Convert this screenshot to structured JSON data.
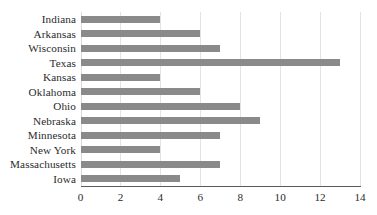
{
  "chart_data": {
    "type": "bar",
    "orientation": "horizontal",
    "title": "",
    "subtitle": "",
    "xlabel": "",
    "ylabel": "",
    "xlim": [
      0,
      14
    ],
    "xticks": [
      0,
      2,
      4,
      6,
      8,
      10,
      12,
      14
    ],
    "xtick_labels": [
      "0",
      "2",
      "4",
      "6",
      "8",
      "10",
      "12",
      "14"
    ],
    "grid": true,
    "grid_axis": "x",
    "legend": false,
    "legend_position": "none",
    "bar_color": "#8a8a8a",
    "gridline_color": "#e3e3e3",
    "axis_color": "#5a5a5a",
    "text_color": "#2b2b2b",
    "categories": [
      "Indiana",
      "Arkansas",
      "Wisconsin",
      "Texas",
      "Kansas",
      "Oklahoma",
      "Ohio",
      "Nebraska",
      "Minnesota",
      "New York",
      "Massachusetts",
      "Iowa"
    ],
    "values": [
      4,
      6,
      7,
      13,
      4,
      6,
      8,
      9,
      7,
      4,
      7,
      5
    ]
  }
}
